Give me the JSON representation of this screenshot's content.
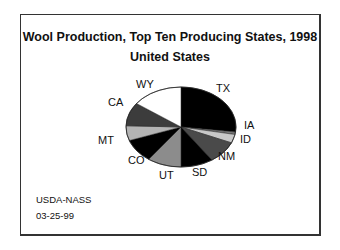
{
  "chart_data": {
    "type": "pie",
    "title": "Wool Production, Top Ten Producing States, 1998",
    "subtitle": "United States",
    "categories": [
      "TX",
      "IA",
      "ID",
      "NM",
      "SD",
      "UT",
      "CO",
      "MT",
      "CA",
      "WY"
    ],
    "values": [
      27,
      1,
      3.5,
      9,
      9.5,
      10,
      9.5,
      6,
      9.5,
      15
    ],
    "unit": "percent (estimated from slice angles)",
    "slice_colors": [
      "#000000",
      "#7a7a7a",
      "#c8c8c8",
      "#4a4a4a",
      "#000000",
      "#8c8c8c",
      "#000000",
      "#b4b4b4",
      "#3c3c3c",
      "#ffffff"
    ],
    "start_angle_deg": 0,
    "direction": "clockwise",
    "legend": "none (labels placed beside slices)"
  },
  "labels": {
    "TX": "TX",
    "IA": "IA",
    "ID": "ID",
    "NM": "NM",
    "SD": "SD",
    "UT": "UT",
    "CO": "CO",
    "MT": "MT",
    "CA": "CA",
    "WY": "WY"
  },
  "footer": {
    "source": "USDA-NASS",
    "date": "03-25-99"
  }
}
